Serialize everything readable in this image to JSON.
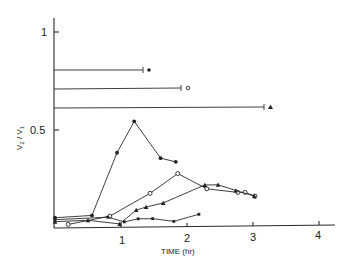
{
  "chart_data": {
    "type": "line",
    "title": "",
    "xlabel": "TIME (hr)",
    "ylabel": "V2 / V1",
    "xlim": [
      0,
      4.3
    ],
    "ylim": [
      0,
      1.1
    ],
    "grid": false,
    "legend": "none (markers at end of horizontal reference bars)",
    "x_ticks": [
      1,
      2,
      3,
      4
    ],
    "x_tick_labels": [
      "1",
      "2",
      "3",
      "4"
    ],
    "y_ticks": [
      0.5,
      1
    ],
    "y_tick_labels": [
      "0.5",
      "1"
    ],
    "reference_bars": [
      {
        "marker": "filled-circle",
        "y": 0.8,
        "x_end": 1.33
      },
      {
        "marker": "open-circle",
        "y": 0.7,
        "x_end": 1.9
      },
      {
        "marker": "filled-triangle",
        "y": 0.61,
        "x_end": 3.2
      }
    ],
    "series": [
      {
        "name": "filled-circle",
        "marker": "filled-circle",
        "x": [
          0,
          0.56,
          0.94,
          1.2,
          1.6,
          1.83
        ],
        "y": [
          0.05,
          0.06,
          0.38,
          0.54,
          0.35,
          0.33
        ]
      },
      {
        "name": "open-circle",
        "marker": "open-circle",
        "x": [
          0.2,
          0.83,
          1.44,
          1.86,
          2.3,
          2.77,
          2.88,
          3.03
        ],
        "y": [
          0.015,
          0.055,
          0.17,
          0.27,
          0.19,
          0.17,
          0.17,
          0.15
        ]
      },
      {
        "name": "filled-triangle",
        "marker": "filled-triangle",
        "x": [
          0,
          0.5,
          0.98,
          1.23,
          1.38,
          1.64,
          2.27,
          2.47,
          2.74,
          3.02
        ],
        "y": [
          0.03,
          0.035,
          0.015,
          0.085,
          0.1,
          0.12,
          0.21,
          0.21,
          0.18,
          0.15
        ]
      },
      {
        "name": "filled-square",
        "marker": "filled-square",
        "x": [
          0,
          0.8,
          1.05,
          1.26,
          1.48,
          1.8,
          2.18
        ],
        "y": [
          0.04,
          0.05,
          0.025,
          0.04,
          0.04,
          0.025,
          0.06
        ]
      }
    ]
  },
  "labels": {
    "x_axis": "TIME (hr)",
    "y_axis_main": "V",
    "y_axis_sub2": "2",
    "y_axis_slash": "/",
    "y_axis_main2": "V",
    "y_axis_sub1": "1",
    "tick_1": "1",
    "tick_2": "2",
    "tick_3": "3",
    "tick_4": "4",
    "ytick_1": "1",
    "ytick_05": "0.5"
  }
}
